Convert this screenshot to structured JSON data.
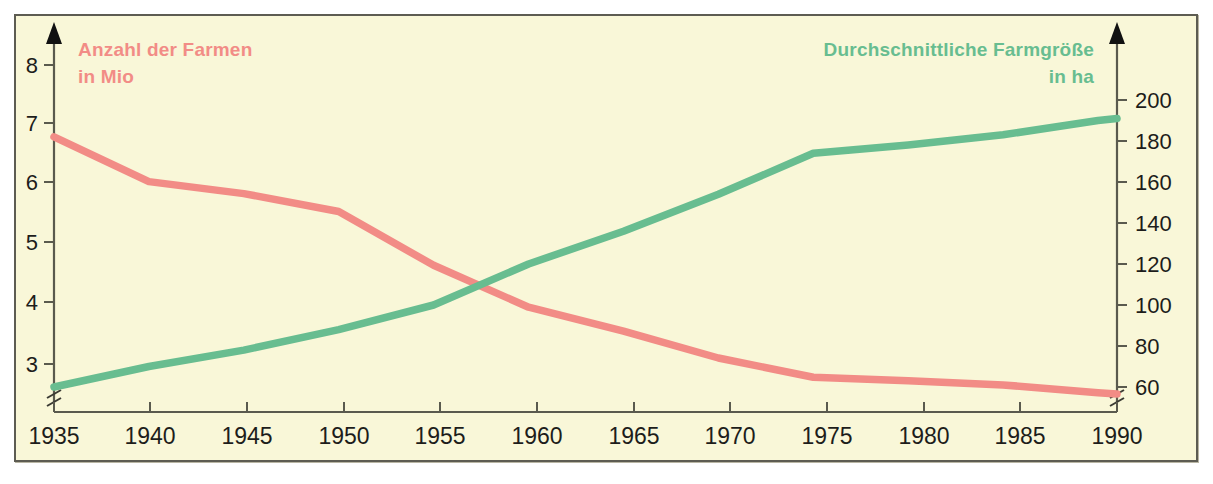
{
  "figure": {
    "background_color": "#f9f7d8",
    "frame_color": "#5d5c52"
  },
  "chart_data": {
    "type": "line",
    "title": "",
    "xlabel": "",
    "grid": false,
    "legend_position": "inline-axis-titles",
    "x": [
      1935,
      1940,
      1945,
      1950,
      1955,
      1960,
      1965,
      1970,
      1975,
      1980,
      1985,
      1990,
      1991
    ],
    "xlim": [
      1935,
      1991
    ],
    "xticks": [
      1935,
      1940,
      1945,
      1950,
      1955,
      1960,
      1965,
      1970,
      1975,
      1980,
      1985,
      1990
    ],
    "xtick_labels": [
      "1935",
      "1940",
      "1945",
      "1950",
      "1955",
      "1960",
      "1965",
      "1970",
      "1975",
      "1980",
      "1985",
      "1990"
    ],
    "axes": [
      {
        "id": "left",
        "label_line1": "Anzahl der Farmen",
        "label_line2": "in Mio",
        "color": "#f28c86",
        "ylim": [
          2.3,
          8.45
        ],
        "yticks": [
          3,
          4,
          5,
          6,
          7,
          8
        ],
        "ytick_labels": [
          "3",
          "4",
          "5",
          "6",
          "7",
          "8"
        ],
        "axis_break": true,
        "unit": "Mio"
      },
      {
        "id": "right",
        "label_line1": "Durchschnittliche Farmgröße",
        "label_line2": "in ha",
        "color": "#68bd90",
        "ylim": [
          48,
          212
        ],
        "yticks": [
          60,
          80,
          100,
          120,
          140,
          160,
          180,
          200
        ],
        "ytick_labels": [
          "60",
          "80",
          "100",
          "120",
          "140",
          "160",
          "180",
          "200"
        ],
        "axis_break": true,
        "unit": "ha"
      }
    ],
    "series": [
      {
        "name": "Anzahl der Farmen in Mio",
        "axis": "left",
        "color": "#f28c86",
        "values": [
          6.8,
          6.05,
          5.85,
          5.55,
          4.65,
          3.95,
          3.55,
          3.1,
          2.78,
          2.72,
          2.65,
          2.52,
          2.5
        ]
      },
      {
        "name": "Durchschnittliche Farmgröße in ha",
        "axis": "right",
        "color": "#68bd90",
        "values": [
          60,
          70,
          78,
          88,
          100,
          120,
          136,
          154,
          174,
          178,
          183,
          190,
          191
        ]
      }
    ]
  }
}
